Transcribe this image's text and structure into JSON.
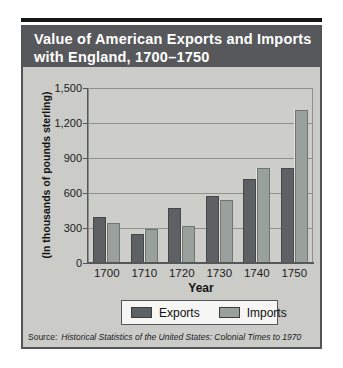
{
  "page": {
    "title_line1": "Value of American Exports and Imports",
    "title_line2": "with England, 1700–1750",
    "source_prefix": "Source:",
    "source_text": "Historical Statistics of the United States: Colonial Times to 1970"
  },
  "colors": {
    "top_rule": "#161616",
    "card_border": "#525456",
    "card_bg": "#cbccc8",
    "title_band": "#57585b",
    "plot_bg": "#cdcec9",
    "grid": "#8e908d",
    "axis": "#55575a",
    "exports": "#5d6164",
    "imports": "#9aa09b",
    "legend_bg": "#f6f6f4"
  },
  "chart_data": {
    "type": "bar",
    "title": "Value of American Exports and Imports with England, 1700–1750",
    "categories": [
      "1700",
      "1710",
      "1720",
      "1730",
      "1740",
      "1750"
    ],
    "series": [
      {
        "name": "Exports",
        "values": [
          395,
          249,
          468,
          573,
          718,
          815
        ]
      },
      {
        "name": "Imports",
        "values": [
          344,
          293,
          319,
          537,
          813,
          1313
        ]
      }
    ],
    "xlabel": "Year",
    "ylabel": "(In thousands of pounds sterling)",
    "ylim": [
      0,
      1500
    ],
    "yticks": [
      "1,500",
      "1,200",
      "900",
      "600",
      "300",
      "0"
    ],
    "ytick_values": [
      1500,
      1200,
      900,
      600,
      300,
      0
    ],
    "grid": true,
    "legend_position": "bottom",
    "source": "Source: Historical Statistics of the United States: Colonial Times to 1970"
  }
}
